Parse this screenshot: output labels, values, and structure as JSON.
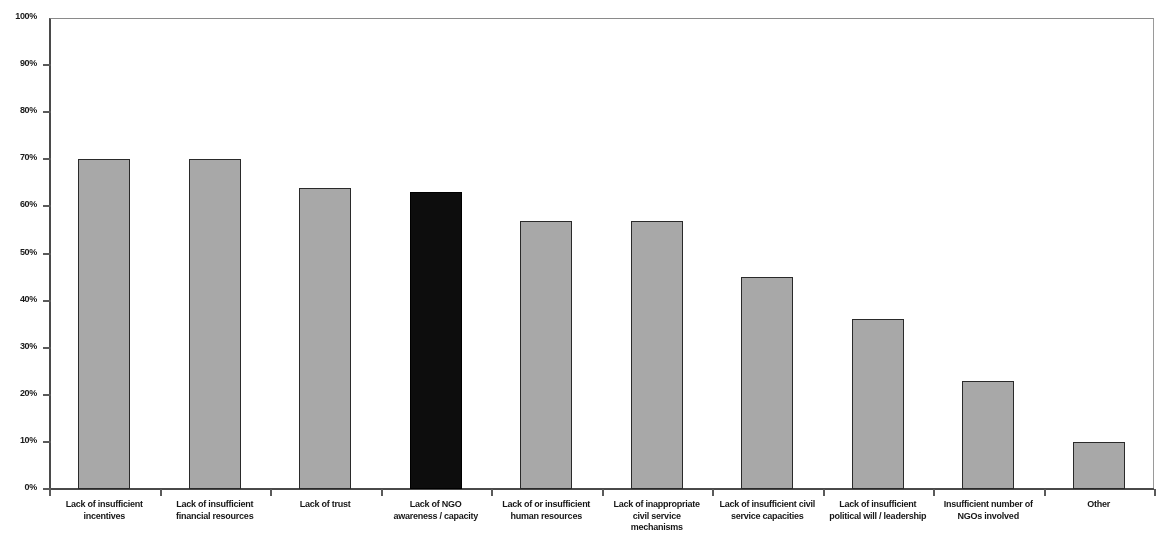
{
  "chart_data": {
    "type": "bar",
    "title": "",
    "subtitle": "",
    "xlabel": "",
    "ylabel": "",
    "ylim": [
      0,
      100
    ],
    "grid": false,
    "legend": null,
    "y_ticks": [
      "0%",
      "10%",
      "20%",
      "30%",
      "40%",
      "50%",
      "60%",
      "70%",
      "80%",
      "90%",
      "100%"
    ],
    "y_tick_values": [
      0,
      10,
      20,
      30,
      40,
      50,
      60,
      70,
      80,
      90,
      100
    ],
    "categories": [
      "Lack of insufficient incentives",
      "Lack of insufficient financial resources",
      "Lack of trust",
      "Lack of NGO awareness / capacity",
      "Lack of or insufficient human resources",
      "Lack of inappropriate civil service mechanisms",
      "Lack of insufficient civil service capacities",
      "Lack of insufficient political will / leadership",
      "Insufficient number of NGOs involved",
      "Other"
    ],
    "category_lines": [
      [
        "Lack of insufficient",
        "incentives"
      ],
      [
        "Lack of insufficient",
        "financial resources"
      ],
      [
        "Lack of trust"
      ],
      [
        "Lack of NGO",
        "awareness / capacity"
      ],
      [
        "Lack of or insufficient",
        "human resources"
      ],
      [
        "Lack of inappropriate",
        "civil service",
        "mechanisms"
      ],
      [
        "Lack of insufficient civil",
        "service capacities"
      ],
      [
        "Lack of insufficient",
        "political will / leadership"
      ],
      [
        "Insufficient number of",
        "NGOs involved"
      ],
      [
        "Other"
      ]
    ],
    "values": [
      70,
      70,
      64,
      63,
      57,
      57,
      45,
      36,
      23,
      10
    ],
    "bar_colors": [
      "#a8a8a8",
      "#a8a8a8",
      "#a8a8a8",
      "#0d0d0d",
      "#a8a8a8",
      "#a8a8a8",
      "#a8a8a8",
      "#a8a8a8",
      "#a8a8a8",
      "#a8a8a8"
    ],
    "highlighted_category": "Lack of NGO awareness / capacity",
    "colors": {
      "bar_default": "#a8a8a8",
      "bar_highlight": "#0d0d0d",
      "bar_outline": "#2a2a2a",
      "axis": "#4a4a4a",
      "text": "#161616",
      "background": "#ffffff"
    }
  }
}
